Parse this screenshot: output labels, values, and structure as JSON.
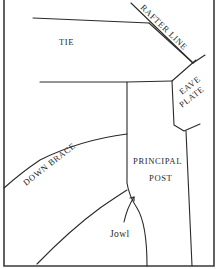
{
  "diagram": {
    "labels": {
      "tie": "TIE",
      "rafter_line": "RAFTER LINE",
      "eave": "EAVE",
      "plate": "PLATE",
      "down_brace": "DOWN BRACE",
      "principal": "PRINCIPAL",
      "post": "POST",
      "jowl": "Jowl"
    },
    "colors": {
      "line": "#2a2a2a",
      "frame": "#3a3a3a",
      "background": "#ffffff"
    }
  }
}
